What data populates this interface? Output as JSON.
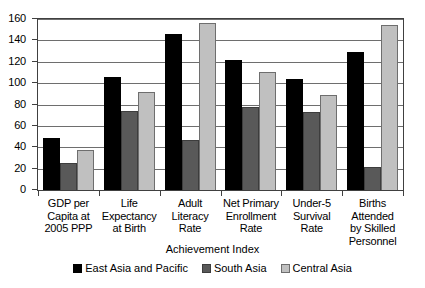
{
  "chart_data": {
    "type": "bar",
    "title": "",
    "xlabel": "Achievement Index",
    "ylabel": "",
    "ylim": [
      0,
      160
    ],
    "ytick_step": 20,
    "yticks": [
      160,
      140,
      120,
      100,
      80,
      60,
      40,
      20,
      0
    ],
    "grid": true,
    "legend_position": "bottom",
    "categories": [
      "GDP per Capita at 2005 PPP",
      "Life Expectancy at Birth",
      "Adult Literacy Rate",
      "Net Primary Enrollment Rate",
      "Under-5 Survival Rate",
      "Births Attended by Skilled Personnel"
    ],
    "category_lines": [
      [
        "GDP per",
        "Capita at",
        "2005 PPP"
      ],
      [
        "Life",
        "Expectancy",
        "at Birth"
      ],
      [
        "Adult",
        "Literacy",
        "Rate"
      ],
      [
        "Net Primary",
        "Enrollment",
        "Rate"
      ],
      [
        "Under-5",
        "Survival",
        "Rate"
      ],
      [
        "Births Attended",
        "by Skilled",
        "Personnel"
      ]
    ],
    "series": [
      {
        "name": "East Asia and Pacific",
        "color": "#000000",
        "values": [
          49,
          106,
          146,
          122,
          104,
          129
        ]
      },
      {
        "name": "South Asia",
        "color": "#595959",
        "values": [
          25,
          74,
          47,
          78,
          73,
          22
        ]
      },
      {
        "name": "Central Asia",
        "color": "#c0c0c0",
        "values": [
          37,
          92,
          156,
          110,
          89,
          154
        ]
      }
    ]
  }
}
